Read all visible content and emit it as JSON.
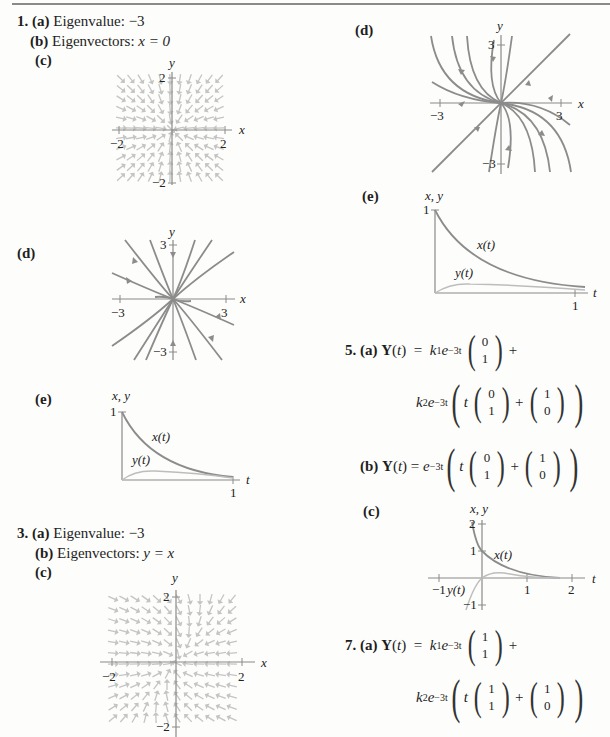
{
  "problems": [
    {
      "number": "1.",
      "a": {
        "label": "(a)",
        "text": "Eigenvalue: ",
        "value": "−3"
      },
      "b": {
        "label": "(b)",
        "text": "Eigenvectors: ",
        "value": "x = 0"
      },
      "c": {
        "label": "(c)",
        "plot": {
          "xlabel": "x",
          "ylabel": "y",
          "xticks": [
            "−2",
            "2"
          ],
          "yticks": [
            "2",
            "−2"
          ]
        }
      },
      "d": {
        "label": "(d)",
        "plot": {
          "xlabel": "x",
          "ylabel": "y",
          "xticks": [
            "−3",
            "3"
          ],
          "yticks": [
            "3",
            "−3"
          ]
        }
      },
      "e": {
        "label": "(e)",
        "plot": {
          "ylabel": "x, y",
          "xlabel": "t",
          "xtick": "1",
          "ytick": "1",
          "curve1": "x(t)",
          "curve2": "y(t)"
        }
      }
    },
    {
      "number": "3.",
      "a": {
        "label": "(a)",
        "text": "Eigenvalue: ",
        "value": "−3"
      },
      "b": {
        "label": "(b)",
        "text": "Eigenvectors: ",
        "value": "y = x"
      },
      "c": {
        "label": "(c)",
        "plot": {
          "xlabel": "x",
          "ylabel": "y",
          "xticks": [
            "−2",
            "2"
          ],
          "yticks": [
            "2",
            "−2"
          ]
        }
      },
      "d": {
        "label": "(d)",
        "plot": {
          "xlabel": "x",
          "ylabel": "y",
          "xticks": [
            "−3",
            "3"
          ],
          "yticks": [
            "3",
            "−3"
          ]
        }
      },
      "e": {
        "label": "(e)",
        "plot": {
          "ylabel": "x, y",
          "xlabel": "t",
          "xtick": "1",
          "ytick": "1",
          "curve1": "x(t)",
          "curve2": "y(t)"
        }
      }
    },
    {
      "number": "5.",
      "a": {
        "label": "(a)",
        "lhs": "Y(t)",
        "eq": "=",
        "k1": "k",
        "k1sub": "1",
        "exp": "e",
        "exppow": "−3t",
        "v1": [
          "0",
          "1"
        ],
        "plus": "+",
        "k2": "k",
        "k2sub": "2",
        "t": "t",
        "v2": [
          "0",
          "1"
        ],
        "v3": [
          "1",
          "0"
        ]
      },
      "b": {
        "label": "(b)",
        "lhs": "Y(t)",
        "eq": "=",
        "exp": "e",
        "exppow": "−3t",
        "t": "t",
        "v1": [
          "0",
          "1"
        ],
        "plus": "+",
        "v2": [
          "1",
          "0"
        ]
      },
      "c": {
        "label": "(c)",
        "plot": {
          "ylabel": "x, y",
          "xlabel": "t",
          "xticks": [
            "−1",
            "1",
            "2"
          ],
          "yticks": [
            "2",
            "1",
            "−1"
          ],
          "curve1": "x(t)",
          "curve2": "y(t)"
        }
      }
    },
    {
      "number": "7.",
      "a": {
        "label": "(a)",
        "lhs": "Y(t)",
        "eq": "=",
        "k1": "k",
        "k1sub": "1",
        "exp": "e",
        "exppow": "−3t",
        "v1": [
          "1",
          "1"
        ],
        "plus": "+",
        "k2": "k",
        "k2sub": "2",
        "t": "t",
        "v2": [
          "1",
          "1"
        ],
        "v3": [
          "1",
          "0"
        ]
      }
    }
  ],
  "colors": {
    "curve": "#8c8c8c",
    "axis": "#8a8a8a",
    "field": "#bdbdbd",
    "text": "#1e1e1e"
  }
}
